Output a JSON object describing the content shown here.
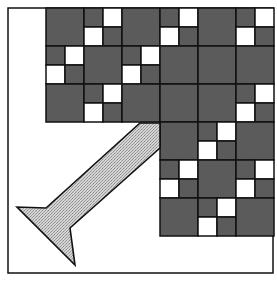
{
  "figure": {
    "frame": {
      "x": 8,
      "y": 8,
      "width": 265,
      "height": 265
    },
    "grid": {
      "origin_x": 46,
      "origin_y": 8,
      "cell_size": 38,
      "cols": 6,
      "rows": 6,
      "legend": {
        "S": "solid dark square",
        "C": "four-patch: dark top-left & bottom-right, white top-right & bottom-left",
        "-": "empty"
      },
      "cells": [
        [
          "S",
          "C",
          "S",
          "C",
          "S",
          "C"
        ],
        [
          "C",
          "S",
          "C",
          "S",
          "S",
          "S"
        ],
        [
          "S",
          "C",
          "S",
          "S",
          "S",
          "C"
        ],
        [
          "-",
          "-",
          "-",
          "S",
          "C",
          "S"
        ],
        [
          "-",
          "-",
          "-",
          "C",
          "S",
          "C"
        ],
        [
          "-",
          "-",
          "-",
          "S",
          "C",
          "S"
        ]
      ]
    },
    "arrow": {
      "points": [
        [
          140,
          123
        ],
        [
          160,
          123
        ],
        [
          160,
          148
        ],
        [
          70,
          228
        ],
        [
          75,
          265
        ],
        [
          17,
          207
        ],
        [
          46,
          208
        ]
      ],
      "fill": "hatched-gray"
    },
    "colors": {
      "dark": "#5b5b5b",
      "light": "#ffffff",
      "line": "#111111",
      "arrow_fill": "#c8c8c8"
    }
  }
}
